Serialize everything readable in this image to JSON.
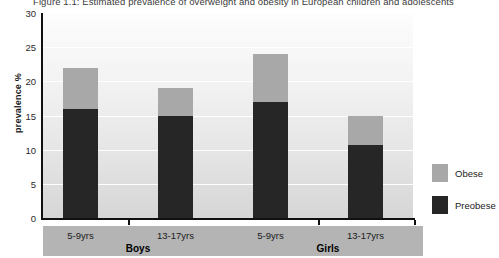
{
  "chart_data": {
    "type": "bar",
    "subtype": "stacked",
    "title": "Figure 1.1: Estimated prevalence of overweight and obesity in European children and adolescents",
    "xlabel": "",
    "ylabel": "prevalence %",
    "ylim": [
      0,
      30
    ],
    "yticks": [
      0,
      5,
      10,
      15,
      20,
      25,
      30
    ],
    "grid": true,
    "legend_position": "right",
    "categories": [
      "5-9yrs",
      "13-17yrs",
      "5-9yrs",
      "13-17yrs"
    ],
    "groups": [
      {
        "name": "Boys",
        "categories": [
          "5-9yrs",
          "13-17yrs"
        ]
      },
      {
        "name": "Girls",
        "categories": [
          "5-9yrs",
          "13-17yrs"
        ]
      }
    ],
    "series": [
      {
        "name": "Preobese",
        "color": "#262626",
        "values": [
          16,
          15,
          17,
          10.7
        ]
      },
      {
        "name": "Obese",
        "color": "#a8a8a8",
        "values": [
          6,
          4,
          7,
          4.3
        ]
      }
    ],
    "totals": [
      22,
      19,
      24,
      15
    ]
  },
  "legend": {
    "items": [
      {
        "label": "Obese",
        "color": "#a8a8a8"
      },
      {
        "label": "Preobese",
        "color": "#262626"
      }
    ]
  }
}
